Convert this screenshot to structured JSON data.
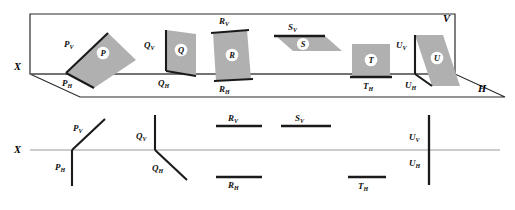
{
  "figure": {
    "type": "descriptive-geometry-plane-traces",
    "colors": {
      "plane_fill": "#b0b0b0",
      "trace_stroke": "#1a1a1a",
      "thin_stroke": "#8c8c8c",
      "box_stroke": "#2b2b2b",
      "background": "#ffffff",
      "disc_fill": "#ffffff"
    }
  },
  "pictorial": {
    "name": "pictorial-view",
    "axis_label": "X",
    "vertical_plane_label": "V",
    "horizontal_plane_label": "H",
    "planes": [
      {
        "id": "P",
        "disc_label": "P",
        "v_trace_label": "P",
        "v_trace_sub": "V",
        "h_trace_label": "P",
        "h_trace_sub": "H",
        "description": "oblique plane tilted to both planes"
      },
      {
        "id": "Q",
        "disc_label": "Q",
        "v_trace_label": "Q",
        "v_trace_sub": "V",
        "h_trace_label": "Q",
        "h_trace_sub": "H",
        "description": "plane perpendicular to V"
      },
      {
        "id": "R",
        "disc_label": "R",
        "v_trace_label": "R",
        "v_trace_sub": "V",
        "h_trace_label": "R",
        "h_trace_sub": "H",
        "description": "plane parallel to X with both traces"
      },
      {
        "id": "S",
        "disc_label": "S",
        "v_trace_label": "S",
        "v_trace_sub": "V",
        "h_trace_label": null,
        "h_trace_sub": null,
        "description": "plane parallel to H, V trace only"
      },
      {
        "id": "T",
        "disc_label": "T",
        "v_trace_label": null,
        "v_trace_sub": null,
        "h_trace_label": "T",
        "h_trace_sub": "H",
        "description": "plane parallel to V, H trace only"
      },
      {
        "id": "U",
        "disc_label": "U",
        "v_trace_label": "U",
        "v_trace_sub": "V",
        "h_trace_label": "U",
        "h_trace_sub": "H",
        "description": "plane perpendicular to both V and H"
      }
    ]
  },
  "orthographic": {
    "name": "orthographic-view",
    "axis_label": "X",
    "traces": [
      {
        "id": "P",
        "v_label": "P",
        "v_sub": "V",
        "h_label": "P",
        "h_sub": "H",
        "v_form": "inclined-up-right",
        "h_form": "vertical-down"
      },
      {
        "id": "Q",
        "v_label": "Q",
        "v_sub": "V",
        "h_label": "Q",
        "h_sub": "H",
        "v_form": "vertical-up",
        "h_form": "inclined-down-right"
      },
      {
        "id": "R",
        "v_label": "R",
        "v_sub": "V",
        "h_label": "R",
        "h_sub": "H",
        "v_form": "horizontal-above",
        "h_form": "horizontal-below"
      },
      {
        "id": "S",
        "v_label": "S",
        "v_sub": "V",
        "h_label": null,
        "h_sub": null,
        "v_form": "horizontal-above",
        "h_form": null
      },
      {
        "id": "T",
        "v_label": null,
        "v_sub": null,
        "h_label": "T",
        "h_sub": "H",
        "v_form": null,
        "h_form": "horizontal-below"
      },
      {
        "id": "U",
        "v_label": "U",
        "v_sub": "V",
        "h_label": "U",
        "h_sub": "H",
        "v_form": "vertical-up",
        "h_form": "vertical-down"
      }
    ]
  }
}
